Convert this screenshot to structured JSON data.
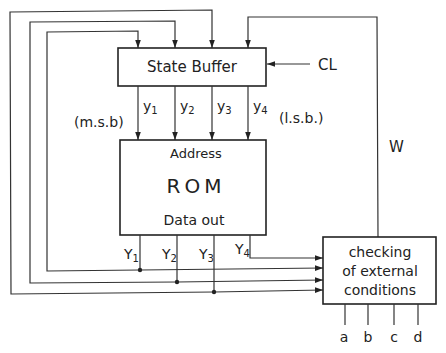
{
  "diagram": {
    "type": "block-diagram",
    "title": "",
    "blocks": {
      "state_buffer": {
        "label": "State Buffer"
      },
      "rom": {
        "address_label": "Address",
        "name_label": "ROM",
        "data_label": "Data out"
      },
      "checker": {
        "line1": "checking",
        "line2": "of external",
        "line3": "conditions"
      }
    },
    "signals": {
      "clock": "CL",
      "feedback": "W",
      "msb": "(m.s.b)",
      "lsb": "(l.s.b.)",
      "state_bits": [
        {
          "base": "y",
          "sub": "1"
        },
        {
          "base": "y",
          "sub": "2"
        },
        {
          "base": "y",
          "sub": "3"
        },
        {
          "base": "y",
          "sub": "4"
        }
      ],
      "rom_outputs": [
        {
          "base": "Y",
          "sub": "1"
        },
        {
          "base": "Y",
          "sub": "2"
        },
        {
          "base": "Y",
          "sub": "3"
        },
        {
          "base": "Y",
          "sub": "4"
        }
      ],
      "external_inputs": [
        "a",
        "b",
        "c",
        "d"
      ]
    },
    "colors": {
      "line": "#333333",
      "background": "#ffffff"
    }
  }
}
